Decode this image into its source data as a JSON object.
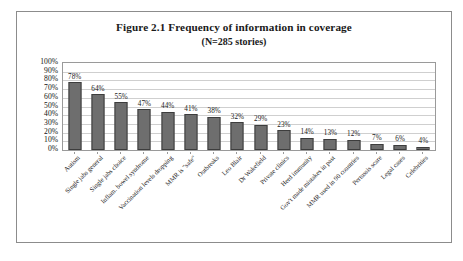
{
  "figure": {
    "title_line_1": "Figure 2.1 Frequency of information in coverage",
    "title_line_2": "(N=285 stories)"
  },
  "chart_data": {
    "type": "bar",
    "title": "Figure 2.1 Frequency of information in coverage",
    "subtitle": "(N=285 stories)",
    "xlabel": "",
    "ylabel": "",
    "ylim": [
      0,
      100
    ],
    "grid": true,
    "legend": "none",
    "orientation": "vertical",
    "value_suffix": "%",
    "ytick_labels": [
      "100%",
      "90%",
      "80%",
      "70%",
      "60%",
      "50%",
      "40%",
      "30%",
      "20%",
      "10%",
      "0%"
    ],
    "ytick_values": [
      100,
      90,
      80,
      70,
      60,
      50,
      40,
      30,
      20,
      10,
      0
    ],
    "categories": [
      "Autism",
      "Single jabs general",
      "Single jabs choice",
      "Inflam. bowel syndrome",
      "Vaccination levels dropping",
      "MMR is \"safe\"",
      "Outbreaks",
      "Leo Blair",
      "Dr Wakefield",
      "Private clinics",
      "Herd immunity",
      "Gov't made mistakes in past",
      "MMR used in 90 countries",
      "Pertussis scare",
      "Legal cases",
      "Celebrities"
    ],
    "values": [
      78,
      64,
      55,
      47,
      44,
      41,
      38,
      32,
      29,
      23,
      14,
      13,
      12,
      7,
      6,
      4
    ],
    "data_labels": [
      "78%",
      "64%",
      "55%",
      "47%",
      "44%",
      "41%",
      "38%",
      "32%",
      "29%",
      "23%",
      "14%",
      "13%",
      "12%",
      "7%",
      "6%",
      "4%"
    ],
    "colors": {
      "bar_fill": "#6e6e6e",
      "bar_border": "#3d3d3d",
      "gridline": "#cfcfcf",
      "plot_border": "#9a9a9a",
      "frame_border": "#8c8c8c",
      "text": "#1a1a1a",
      "background": "#ffffff"
    }
  }
}
